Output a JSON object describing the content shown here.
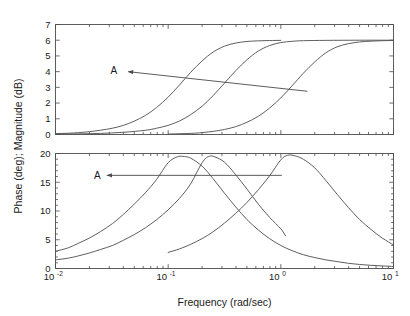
{
  "chart_data": {
    "type": "line",
    "title": "",
    "subtitle": "",
    "xlabel": "Frequency (rad/sec)",
    "ylabel": "Phase (deg); Magnitude (dB)",
    "xscale": "log",
    "xlim": [
      0.01,
      10
    ],
    "xticks": [
      0.01,
      0.1,
      1,
      10
    ],
    "xticklabels": [
      "10-2",
      "10-1",
      "100",
      "101"
    ],
    "xtick_mantissas": [
      "10",
      "10",
      "10",
      "10"
    ],
    "xtick_exponents": [
      "-2",
      "-1",
      "0",
      "1"
    ],
    "grid": false,
    "legend": false,
    "panels": [
      {
        "name": "magnitude-panel",
        "ylabel_part": "Magnitude (dB)",
        "ylim": [
          0,
          7
        ],
        "yticks": [
          0,
          1,
          2,
          3,
          4,
          5,
          6,
          7
        ],
        "yticklabels": [
          "0",
          "1",
          "2",
          "3",
          "4",
          "5",
          "6",
          "7"
        ],
        "annotation": {
          "label": "A",
          "label_x": 0.033,
          "label_y": 4.05,
          "arrow_tip_x": 0.044,
          "arrow_tip_y": 4.0,
          "arrow_tail_x": 1.72,
          "arrow_tail_y": 2.75
        },
        "series": [
          {
            "name": "magnitude-curve-1",
            "corner_frequency": 0.105,
            "gain_db": 6.0,
            "x_start": 0.01,
            "x_end": 1.0,
            "points": [
              [
                0.01,
                0.06
              ],
              [
                0.013,
                0.08
              ],
              [
                0.016,
                0.12
              ],
              [
                0.02,
                0.18
              ],
              [
                0.025,
                0.27
              ],
              [
                0.032,
                0.4
              ],
              [
                0.04,
                0.58
              ],
              [
                0.05,
                0.85
              ],
              [
                0.063,
                1.22
              ],
              [
                0.079,
                1.72
              ],
              [
                0.1,
                2.38
              ],
              [
                0.126,
                3.15
              ],
              [
                0.158,
                3.95
              ],
              [
                0.2,
                4.68
              ],
              [
                0.251,
                5.25
              ],
              [
                0.316,
                5.62
              ],
              [
                0.398,
                5.82
              ],
              [
                0.501,
                5.92
              ],
              [
                0.631,
                5.96
              ],
              [
                0.794,
                5.98
              ],
              [
                1.0,
                5.99
              ]
            ]
          },
          {
            "name": "magnitude-curve-2",
            "corner_frequency": 0.225,
            "gain_db": 6.0,
            "x_start": 0.01,
            "x_end": 10.0,
            "points": [
              [
                0.01,
                0.02
              ],
              [
                0.016,
                0.04
              ],
              [
                0.025,
                0.07
              ],
              [
                0.04,
                0.14
              ],
              [
                0.063,
                0.27
              ],
              [
                0.079,
                0.4
              ],
              [
                0.1,
                0.58
              ],
              [
                0.126,
                0.86
              ],
              [
                0.158,
                1.26
              ],
              [
                0.2,
                1.8
              ],
              [
                0.251,
                2.48
              ],
              [
                0.316,
                3.27
              ],
              [
                0.398,
                4.06
              ],
              [
                0.501,
                4.76
              ],
              [
                0.631,
                5.31
              ],
              [
                0.794,
                5.66
              ],
              [
                1.0,
                5.85
              ],
              [
                1.259,
                5.93
              ],
              [
                1.585,
                5.97
              ],
              [
                2.512,
                5.99
              ],
              [
                5.012,
                6.0
              ],
              [
                10.0,
                6.0
              ]
            ]
          },
          {
            "name": "magnitude-curve-3",
            "corner_frequency": 1.15,
            "gain_db": 6.0,
            "x_start": 0.1,
            "x_end": 10.0,
            "points": [
              [
                0.1,
                0.03
              ],
              [
                0.158,
                0.07
              ],
              [
                0.2,
                0.12
              ],
              [
                0.251,
                0.2
              ],
              [
                0.316,
                0.32
              ],
              [
                0.398,
                0.5
              ],
              [
                0.501,
                0.78
              ],
              [
                0.631,
                1.16
              ],
              [
                0.794,
                1.68
              ],
              [
                1.0,
                2.33
              ],
              [
                1.259,
                3.1
              ],
              [
                1.585,
                3.9
              ],
              [
                2.0,
                4.62
              ],
              [
                2.512,
                5.2
              ],
              [
                3.162,
                5.58
              ],
              [
                3.981,
                5.78
              ],
              [
                5.012,
                5.89
              ],
              [
                6.31,
                5.94
              ],
              [
                7.943,
                5.97
              ],
              [
                10.0,
                5.98
              ]
            ]
          }
        ]
      },
      {
        "name": "phase-panel",
        "ylabel_part": "Phase (deg)",
        "ylim": [
          0,
          20
        ],
        "yticks": [
          0,
          5,
          10,
          15,
          20
        ],
        "yticklabels": [
          "0",
          "5",
          "10",
          "15",
          "20"
        ],
        "annotation": {
          "label": "A",
          "label_x": 0.0235,
          "label_y": 16.2,
          "arrow_tip_x": 0.0285,
          "arrow_tip_y": 16.2,
          "arrow_tail_x": 1.02,
          "arrow_tail_y": 16.2
        },
        "series": [
          {
            "name": "phase-curve-1",
            "peak_frequency": 0.105,
            "peak_value": 19.5,
            "x_start": 0.01,
            "x_end": 10.0,
            "points": [
              [
                0.01,
                3.0
              ],
              [
                0.013,
                3.6
              ],
              [
                0.016,
                4.4
              ],
              [
                0.02,
                5.3
              ],
              [
                0.025,
                6.4
              ],
              [
                0.032,
                7.8
              ],
              [
                0.04,
                9.4
              ],
              [
                0.05,
                11.2
              ],
              [
                0.063,
                13.2
              ],
              [
                0.079,
                15.5
              ],
              [
                0.1,
                18.4
              ],
              [
                0.12,
                19.4
              ],
              [
                0.135,
                19.5
              ],
              [
                0.158,
                19.2
              ],
              [
                0.2,
                17.8
              ],
              [
                0.251,
                15.6
              ],
              [
                0.316,
                13.1
              ],
              [
                0.398,
                10.7
              ],
              [
                0.501,
                8.5
              ],
              [
                0.631,
                6.7
              ],
              [
                0.794,
                5.2
              ],
              [
                1.0,
                4.0
              ],
              [
                1.259,
                3.1
              ],
              [
                1.585,
                2.4
              ],
              [
                2.0,
                1.9
              ],
              [
                2.512,
                1.5
              ],
              [
                3.162,
                1.2
              ],
              [
                3.981,
                0.9
              ],
              [
                5.012,
                0.7
              ],
              [
                6.31,
                0.55
              ],
              [
                7.943,
                0.45
              ],
              [
                10.0,
                0.35
              ]
            ]
          },
          {
            "name": "phase-curve-2",
            "peak_frequency": 0.215,
            "peak_value": 19.5,
            "x_start": 0.01,
            "x_end": 1.1,
            "points": [
              [
                0.01,
                1.5
              ],
              [
                0.013,
                1.8
              ],
              [
                0.016,
                2.2
              ],
              [
                0.02,
                2.7
              ],
              [
                0.025,
                3.3
              ],
              [
                0.032,
                4.0
              ],
              [
                0.04,
                4.9
              ],
              [
                0.05,
                5.9
              ],
              [
                0.063,
                7.1
              ],
              [
                0.079,
                8.5
              ],
              [
                0.1,
                10.2
              ],
              [
                0.126,
                12.2
              ],
              [
                0.158,
                14.7
              ],
              [
                0.2,
                18.4
              ],
              [
                0.23,
                19.5
              ],
              [
                0.26,
                19.4
              ],
              [
                0.316,
                18.5
              ],
              [
                0.398,
                16.3
              ],
              [
                0.501,
                13.8
              ],
              [
                0.631,
                11.2
              ],
              [
                0.794,
                8.9
              ],
              [
                1.0,
                6.9
              ],
              [
                1.1,
                5.7
              ]
            ]
          },
          {
            "name": "phase-curve-3",
            "peak_frequency": 1.15,
            "peak_value": 19.7,
            "x_start": 0.1,
            "x_end": 10.0,
            "points": [
              [
                0.1,
                2.8
              ],
              [
                0.126,
                3.4
              ],
              [
                0.158,
                4.2
              ],
              [
                0.2,
                5.2
              ],
              [
                0.251,
                6.4
              ],
              [
                0.316,
                7.9
              ],
              [
                0.398,
                9.6
              ],
              [
                0.501,
                11.5
              ],
              [
                0.631,
                13.7
              ],
              [
                0.794,
                16.1
              ],
              [
                1.0,
                18.9
              ],
              [
                1.15,
                19.7
              ],
              [
                1.33,
                19.6
              ],
              [
                1.585,
                19.0
              ],
              [
                2.0,
                17.5
              ],
              [
                2.512,
                15.3
              ],
              [
                3.162,
                12.9
              ],
              [
                3.981,
                10.6
              ],
              [
                5.012,
                8.5
              ],
              [
                6.31,
                6.8
              ],
              [
                7.943,
                5.3
              ],
              [
                10.0,
                4.1
              ]
            ]
          }
        ]
      }
    ]
  },
  "axes": {
    "x_title": "Frequency (rad/sec)",
    "y_title": "Phase (deg); Magnitude (dB)"
  },
  "annotations": {
    "upper_label": "A",
    "lower_label": "A"
  }
}
